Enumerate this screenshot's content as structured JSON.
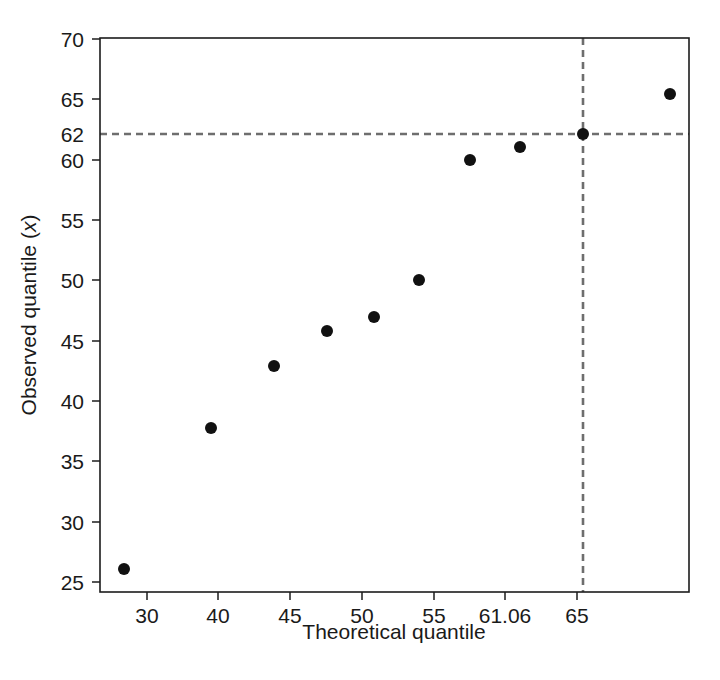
{
  "chart_data": {
    "type": "scatter",
    "title": "",
    "xlabel": "Theoretical quantile",
    "ylabel": "Observed quantile (x)",
    "ylabel_plain": "Observed quantile (",
    "ylabel_italic": "x",
    "ylabel_close": ")",
    "x": [
      28.0,
      37.5,
      42.3,
      45.4,
      48.3,
      51.2,
      54.2,
      57.2,
      61.06,
      66.4
    ],
    "values": [
      26,
      38,
      43,
      46,
      47,
      50,
      60,
      61,
      62,
      65
    ],
    "points": [
      {
        "x": 28.0,
        "y": 26,
        "px": 124,
        "py": 569
      },
      {
        "x": 37.5,
        "y": 38,
        "px": 211,
        "py": 428
      },
      {
        "x": 42.3,
        "y": 43,
        "px": 274,
        "py": 366
      },
      {
        "x": 45.4,
        "y": 46,
        "px": 327,
        "py": 331
      },
      {
        "x": 48.3,
        "y": 47,
        "px": 374,
        "py": 317
      },
      {
        "x": 51.2,
        "y": 50,
        "px": 419,
        "py": 280
      },
      {
        "x": 54.2,
        "y": 60,
        "px": 470,
        "py": 160
      },
      {
        "x": 57.2,
        "y": 61,
        "px": 520,
        "py": 147
      },
      {
        "x": 61.06,
        "y": 62,
        "px": 583,
        "py": 134
      },
      {
        "x": 66.4,
        "y": 65,
        "px": 670,
        "py": 94
      }
    ],
    "xticks": [
      {
        "label": "30",
        "px": 147
      },
      {
        "label": "40",
        "px": 218
      },
      {
        "label": "45",
        "px": 290
      },
      {
        "label": "50",
        "px": 362
      },
      {
        "label": "55",
        "px": 434
      },
      {
        "label": "61.06",
        "px": 505
      },
      {
        "label": "65",
        "px": 577
      }
    ],
    "yticks": [
      {
        "label": "25",
        "py": 582,
        "tick": true
      },
      {
        "label": "30",
        "py": 522,
        "tick": true
      },
      {
        "label": "35",
        "py": 461,
        "tick": true
      },
      {
        "label": "40",
        "py": 401,
        "tick": true
      },
      {
        "label": "45",
        "py": 341,
        "tick": true
      },
      {
        "label": "50",
        "py": 280,
        "tick": true
      },
      {
        "label": "55",
        "py": 220,
        "tick": true
      },
      {
        "label": "60",
        "py": 160,
        "tick": true
      },
      {
        "label": "62",
        "py": 134,
        "tick": false
      },
      {
        "label": "65",
        "py": 99,
        "tick": true
      },
      {
        "label": "70",
        "py": 39,
        "tick": true
      }
    ],
    "reference_lines": [
      {
        "orientation": "horizontal",
        "value": 62,
        "py": 134,
        "style": "dashed",
        "color": "#6e6e6e"
      },
      {
        "orientation": "vertical",
        "value": 61.06,
        "px": 583,
        "style": "dashed",
        "color": "#6e6e6e"
      }
    ],
    "xlim": [
      25.5,
      68.5
    ],
    "ylim": [
      25,
      70
    ],
    "grid": false,
    "legend": null,
    "marker_color": "#111111",
    "marker_size": 11,
    "axis_color": "#1c1c1c",
    "background": "#ffffff"
  }
}
